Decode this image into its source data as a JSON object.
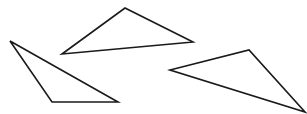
{
  "canvas": {
    "width": 307,
    "height": 114,
    "background": "#ffffff"
  },
  "stroke": {
    "color": "#1a1a1a",
    "width": 1.6
  },
  "shapes": [
    {
      "name": "triangle-top",
      "points": [
        [
          62,
          54
        ],
        [
          125,
          8
        ],
        [
          193,
          42
        ]
      ]
    },
    {
      "name": "triangle-left",
      "points": [
        [
          10,
          41
        ],
        [
          52,
          102
        ],
        [
          118,
          102
        ]
      ]
    },
    {
      "name": "triangle-right",
      "points": [
        [
          170,
          70
        ],
        [
          249,
          50
        ],
        [
          305,
          112
        ]
      ]
    }
  ]
}
